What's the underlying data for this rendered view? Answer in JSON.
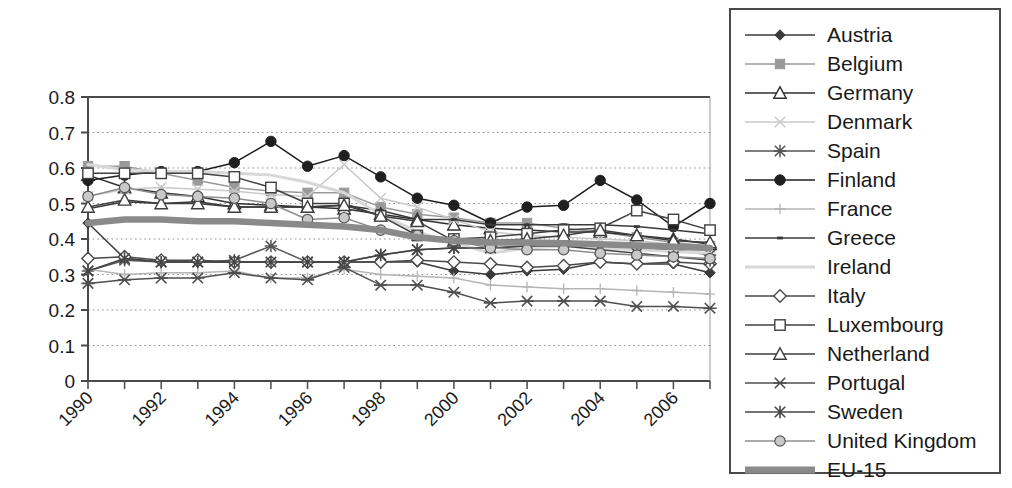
{
  "chart_data": {
    "type": "line",
    "title": "",
    "xlabel": "",
    "ylabel": "",
    "xlim": [
      1990,
      2007
    ],
    "ylim": [
      0,
      0.8
    ],
    "grid": true,
    "legend_position": "right",
    "x": [
      1990,
      1991,
      1992,
      1993,
      1994,
      1995,
      1996,
      1997,
      1998,
      1999,
      2000,
      2001,
      2002,
      2003,
      2004,
      2005,
      2006,
      2007
    ],
    "xticks": [
      "1990",
      "1992",
      "1994",
      "1996",
      "1998",
      "2000",
      "2002",
      "2004",
      "2006"
    ],
    "yticks": [
      "0",
      "0.1",
      "0.2",
      "0.3",
      "0.4",
      "0.5",
      "0.6",
      "0.7",
      "0.8"
    ],
    "series": [
      {
        "name": "Austria",
        "color": "#3a3a3a",
        "marker": "diamond-filled",
        "values": [
          0.445,
          0.345,
          0.335,
          0.335,
          0.335,
          0.335,
          0.335,
          0.335,
          0.335,
          0.335,
          0.31,
          0.3,
          0.31,
          0.315,
          0.335,
          0.33,
          0.33,
          0.305
        ]
      },
      {
        "name": "Belgium",
        "color": "#9a9a9a",
        "marker": "square-filled",
        "values": [
          0.605,
          0.605,
          0.585,
          0.565,
          0.545,
          0.535,
          0.53,
          0.53,
          0.49,
          0.47,
          0.46,
          0.445,
          0.445,
          0.43,
          0.42,
          0.405,
          0.39,
          0.38
        ]
      },
      {
        "name": "Germany",
        "color": "#2f2f2f",
        "marker": "triangle-open",
        "values": [
          0.58,
          0.545,
          0.53,
          0.52,
          0.5,
          0.495,
          0.49,
          0.485,
          0.47,
          0.455,
          0.44,
          0.43,
          0.425,
          0.42,
          0.42,
          0.41,
          0.4,
          0.385
        ]
      },
      {
        "name": "Denmark",
        "color": "#c9c9c9",
        "marker": "x-thin",
        "values": [
          0.52,
          0.54,
          0.545,
          0.54,
          0.535,
          0.525,
          0.52,
          0.61,
          0.515,
          0.49,
          0.455,
          0.42,
          0.41,
          0.405,
          0.4,
          0.395,
          0.385,
          0.375
        ]
      },
      {
        "name": "Spain",
        "color": "#555555",
        "marker": "star",
        "values": [
          0.31,
          0.34,
          0.335,
          0.335,
          0.34,
          0.38,
          0.335,
          0.335,
          0.355,
          0.37,
          0.375,
          0.375,
          0.38,
          0.38,
          0.375,
          0.37,
          0.37,
          0.355
        ]
      },
      {
        "name": "Finland",
        "color": "#1f1f1f",
        "marker": "circle-filled",
        "values": [
          0.565,
          0.58,
          0.59,
          0.59,
          0.615,
          0.675,
          0.605,
          0.635,
          0.575,
          0.515,
          0.495,
          0.445,
          0.49,
          0.495,
          0.565,
          0.51,
          0.435,
          0.5
        ]
      },
      {
        "name": "France",
        "color": "#b5b5b5",
        "marker": "plus",
        "values": [
          0.315,
          0.3,
          0.305,
          0.305,
          0.31,
          0.29,
          0.29,
          0.315,
          0.3,
          0.295,
          0.29,
          0.27,
          0.265,
          0.26,
          0.26,
          0.255,
          0.25,
          0.245
        ]
      },
      {
        "name": "Greece",
        "color": "#3a3a3a",
        "marker": "dash",
        "values": [
          0.485,
          0.505,
          0.5,
          0.505,
          0.49,
          0.49,
          0.49,
          0.495,
          0.48,
          0.455,
          0.455,
          0.44,
          0.44,
          0.44,
          0.44,
          0.435,
          0.425,
          0.415
        ]
      },
      {
        "name": "Ireland",
        "color": "#d8d8d8",
        "marker": "none",
        "values": [
          0.61,
          0.595,
          0.59,
          0.59,
          0.585,
          0.58,
          0.56,
          0.53,
          0.47,
          0.42,
          0.39,
          0.36,
          0.375,
          0.38,
          0.375,
          0.37,
          0.365,
          0.36
        ]
      },
      {
        "name": "Italy",
        "color": "#4a4a4a",
        "marker": "diamond-open",
        "values": [
          0.345,
          0.35,
          0.34,
          0.34,
          0.335,
          0.335,
          0.335,
          0.335,
          0.335,
          0.34,
          0.335,
          0.33,
          0.32,
          0.325,
          0.335,
          0.33,
          0.335,
          0.33
        ]
      },
      {
        "name": "Luxembourg",
        "color": "#404040",
        "marker": "square-open",
        "values": [
          0.585,
          0.585,
          0.585,
          0.585,
          0.575,
          0.545,
          0.5,
          0.5,
          0.465,
          0.41,
          0.4,
          0.405,
          0.415,
          0.425,
          0.43,
          0.48,
          0.455,
          0.425
        ]
      },
      {
        "name": "Netherland",
        "color": "#3d3d3d",
        "marker": "triangle-open",
        "values": [
          0.49,
          0.51,
          0.5,
          0.5,
          0.49,
          0.49,
          0.49,
          0.495,
          0.465,
          0.45,
          0.395,
          0.395,
          0.4,
          0.41,
          0.425,
          0.41,
          0.395,
          0.39
        ]
      },
      {
        "name": "Portugal",
        "color": "#4f4f4f",
        "marker": "x-thick",
        "values": [
          0.275,
          0.285,
          0.29,
          0.29,
          0.305,
          0.29,
          0.285,
          0.32,
          0.27,
          0.27,
          0.25,
          0.22,
          0.225,
          0.225,
          0.225,
          0.21,
          0.21,
          0.205
        ]
      },
      {
        "name": "Sweden",
        "color": "#444444",
        "marker": "asterisk",
        "values": [
          0.31,
          0.345,
          0.335,
          0.335,
          0.335,
          0.335,
          0.335,
          0.335,
          0.355,
          0.37,
          0.375,
          0.375,
          0.38,
          0.38,
          0.37,
          0.36,
          0.35,
          0.34
        ]
      },
      {
        "name": "United Kingdom",
        "color": "#8e8e8e",
        "marker": "circle-open",
        "values": [
          0.52,
          0.545,
          0.525,
          0.52,
          0.515,
          0.5,
          0.455,
          0.46,
          0.425,
          0.41,
          0.395,
          0.375,
          0.37,
          0.37,
          0.36,
          0.355,
          0.35,
          0.345
        ]
      },
      {
        "name": "EU-15",
        "color": "#8a8a8a",
        "marker": "thick-band",
        "values": [
          0.445,
          0.455,
          0.455,
          0.45,
          0.45,
          0.445,
          0.44,
          0.435,
          0.425,
          0.405,
          0.395,
          0.39,
          0.39,
          0.388,
          0.385,
          0.382,
          0.378,
          0.375
        ]
      }
    ]
  },
  "legend": {
    "items": [
      {
        "label": "Austria"
      },
      {
        "label": "Belgium"
      },
      {
        "label": "Germany"
      },
      {
        "label": "Denmark"
      },
      {
        "label": "Spain"
      },
      {
        "label": "Finland"
      },
      {
        "label": "France"
      },
      {
        "label": "Greece"
      },
      {
        "label": "Ireland"
      },
      {
        "label": "Italy"
      },
      {
        "label": "Luxembourg"
      },
      {
        "label": "Netherland"
      },
      {
        "label": "Portugal"
      },
      {
        "label": "Sweden"
      },
      {
        "label": "United Kingdom"
      },
      {
        "label": "EU-15"
      }
    ]
  },
  "colors": {
    "axis": "#4a4a4a",
    "grid": "#8a8a8a",
    "text": "#1a1a1a",
    "legend_border": "#4a4a4a",
    "background": "#ffffff"
  }
}
